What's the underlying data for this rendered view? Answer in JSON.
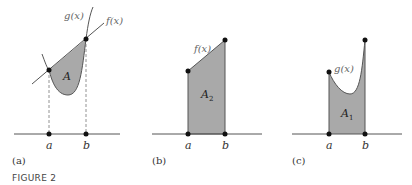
{
  "figure_label": "FIGURE 2",
  "colors": {
    "shade": "#a9a9a9",
    "line": "#555555",
    "dot": "#111111",
    "axis": "#555555"
  },
  "panels": [
    {
      "id": "a",
      "caption": "(a)",
      "curve_labels": {
        "g": "g(x)",
        "f": "f(x)"
      },
      "region_label": "A",
      "region_sub": "",
      "axis_labels": {
        "a": "a",
        "b": "b"
      }
    },
    {
      "id": "b",
      "caption": "(b)",
      "curve_labels": {
        "f": "f(x)"
      },
      "region_label": "A",
      "region_sub": "2",
      "axis_labels": {
        "a": "a",
        "b": "b"
      }
    },
    {
      "id": "c",
      "caption": "(c)",
      "curve_labels": {
        "g": "g(x)"
      },
      "region_label": "A",
      "region_sub": "1",
      "axis_labels": {
        "a": "a",
        "b": "b"
      }
    }
  ]
}
